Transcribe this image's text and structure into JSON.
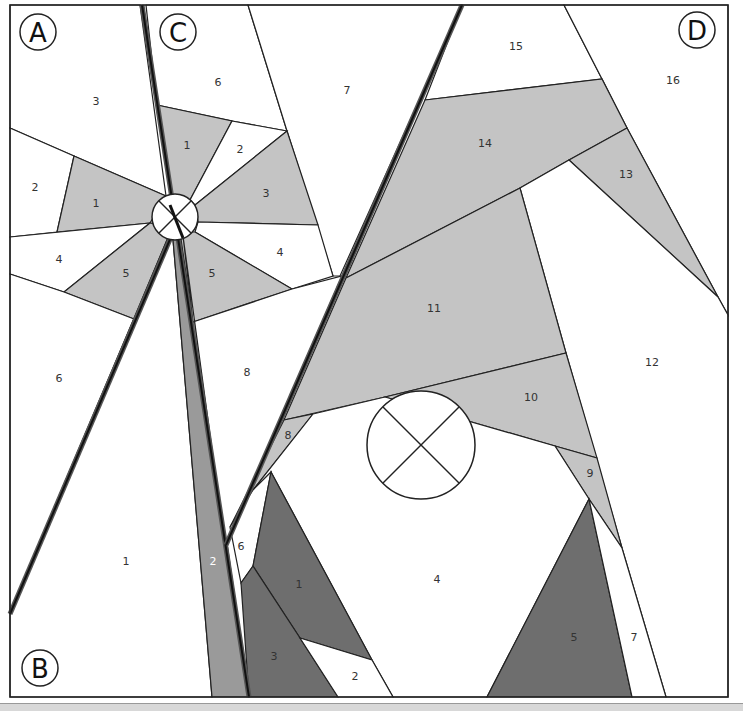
{
  "diagram": {
    "colors": {
      "background": "#ffffff",
      "light_gray": "#c4c4c4",
      "medium_gray": "#b8b8b8",
      "strip_gray": "#999999",
      "dark_gray": "#6e6e6e",
      "line": "#222222"
    },
    "corner_labels": {
      "A": "A",
      "B": "B",
      "C": "C",
      "D": "D"
    },
    "sections": {
      "A": {
        "pieces": [
          {
            "id": "A1",
            "label": "1",
            "fill": "light_gray"
          },
          {
            "id": "A2",
            "label": "2",
            "fill": "white"
          },
          {
            "id": "A3",
            "label": "3",
            "fill": "white"
          },
          {
            "id": "A4",
            "label": "4",
            "fill": "white"
          },
          {
            "id": "A5",
            "label": "5",
            "fill": "light_gray"
          },
          {
            "id": "A6",
            "label": "6",
            "fill": "white"
          }
        ]
      },
      "B": {
        "pieces": [
          {
            "id": "B1",
            "label": "1",
            "fill": "white"
          },
          {
            "id": "B2",
            "label": "2",
            "fill": "strip_gray"
          }
        ]
      },
      "C": {
        "pieces": [
          {
            "id": "C1",
            "label": "1",
            "fill": "light_gray"
          },
          {
            "id": "C2",
            "label": "2",
            "fill": "white"
          },
          {
            "id": "C3",
            "label": "3",
            "fill": "light_gray"
          },
          {
            "id": "C4",
            "label": "4",
            "fill": "white"
          },
          {
            "id": "C5",
            "label": "5",
            "fill": "light_gray"
          },
          {
            "id": "C6",
            "label": "6",
            "fill": "white"
          },
          {
            "id": "C7",
            "label": "7",
            "fill": "white"
          },
          {
            "id": "C8",
            "label": "8",
            "fill": "white"
          }
        ]
      },
      "D": {
        "pieces": [
          {
            "id": "D1",
            "label": "1",
            "fill": "dark_gray"
          },
          {
            "id": "D2",
            "label": "2",
            "fill": "white"
          },
          {
            "id": "D3",
            "label": "3",
            "fill": "dark_gray"
          },
          {
            "id": "D4",
            "label": "4",
            "fill": "white"
          },
          {
            "id": "D5",
            "label": "5",
            "fill": "dark_gray"
          },
          {
            "id": "D6",
            "label": "6",
            "fill": "white"
          },
          {
            "id": "D7",
            "label": "7",
            "fill": "white"
          },
          {
            "id": "D8",
            "label": "8",
            "fill": "light_gray"
          },
          {
            "id": "D9",
            "label": "9",
            "fill": "light_gray"
          },
          {
            "id": "D10",
            "label": "10",
            "fill": "light_gray"
          },
          {
            "id": "D11",
            "label": "11",
            "fill": "light_gray"
          },
          {
            "id": "D12",
            "label": "12",
            "fill": "white"
          },
          {
            "id": "D13",
            "label": "13",
            "fill": "light_gray"
          },
          {
            "id": "D14",
            "label": "14",
            "fill": "light_gray"
          },
          {
            "id": "D15",
            "label": "15",
            "fill": "white"
          },
          {
            "id": "D16",
            "label": "16",
            "fill": "white"
          }
        ]
      }
    },
    "markers": [
      {
        "name": "small-crossed-circle",
        "description": "pinwheel center marker"
      },
      {
        "name": "large-crossed-circle",
        "description": "center marker in section D"
      }
    ]
  }
}
